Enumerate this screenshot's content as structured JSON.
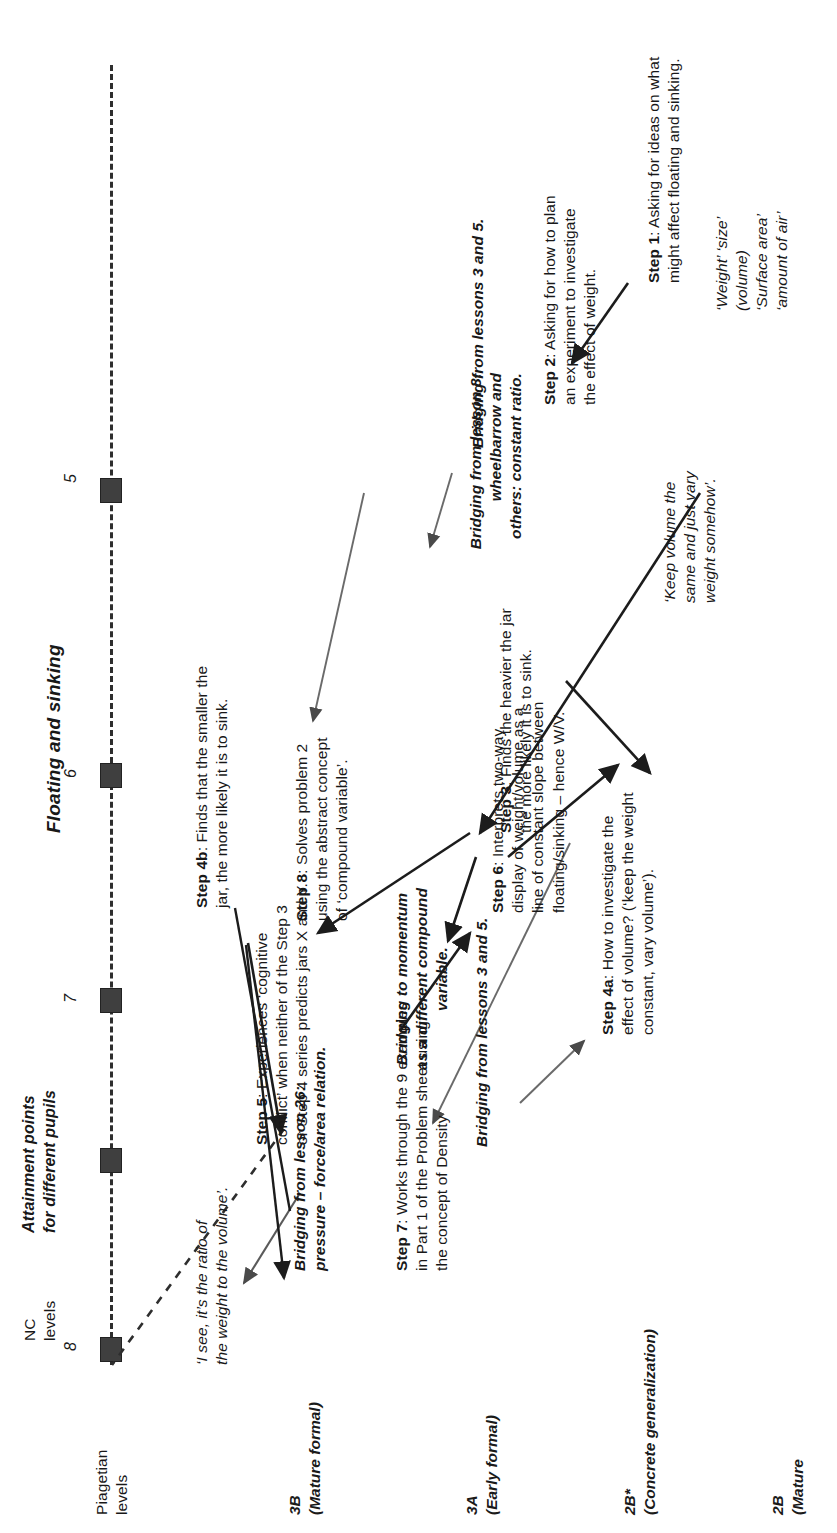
{
  "title": "Floating and sinking",
  "axis": {
    "nc_label": "NC\nlevels",
    "attainment_label": "Attainment points\nfor different pupils",
    "ticks": [
      "8",
      "7",
      "6",
      "5"
    ],
    "marker_count": 5,
    "marker_color": "#3f3f3f"
  },
  "piagetian": {
    "heading": "Piagetian\nlevels",
    "levels": [
      {
        "code": "3B",
        "desc": "(Mature\nformal)"
      },
      {
        "code": "3A",
        "desc": "(Early\nformal)"
      },
      {
        "code": "2B*",
        "desc": "(Concrete\ngeneralization)"
      },
      {
        "code": "2B",
        "desc": "(Mature"
      }
    ]
  },
  "bridges": {
    "momentum": "Bridging to momentum\nas a different compound\nvariable.",
    "lesson26": "Bridging from lesson 26:\npressure – force/area relation.",
    "lesson8": "Bridging from lesson 8:\nwheelbarrow and\nothers: constant ratio.",
    "lessons35_upper": "Bridging from lessons 3 and 5.",
    "lessons35_lower": "Bridging from lessons 3 and 5."
  },
  "quotes": {
    "ratio": "‘I see, it’s the ratio of\nthe weight to the volume’.",
    "keep_volume": "‘Keep volume the\nsame and just vary\nweight somehow’.",
    "ideas_list": "‘Weight’ ‘size’\n(volume)\n‘Surface area’\n‘amount of air’"
  },
  "steps": [
    {
      "id": "step8",
      "label": "Step 8",
      "text": ": Solves problem 2\nusing the abstract concept\nof ‘compound variable’."
    },
    {
      "id": "step7",
      "label": "Step 7",
      "text": ": Works through the 9 examples\nin Part 1 of the Problem sheet using\nthe concept of Density"
    },
    {
      "id": "step6",
      "label": "Step 6",
      "text": ": Interprets two-way\ndisplay of weight/volume as a\nline of constant slope between\nfloating/sinking – hence W/V."
    },
    {
      "id": "step5",
      "label": "Step 5",
      "text": ": Experiences ‘cognitive\nconflict’ when neither of the Step 3\nor Step 4 series predicts jars X and Y."
    },
    {
      "id": "step4a",
      "label": "Step 4a",
      "text": ": How to investigate the\neffect of volume? (‘keep the weight\nconstant, vary volume’)."
    },
    {
      "id": "step4b",
      "label": "Step 4b",
      "text": ": Finds that the smaller the\njar, the more likely it is to sink."
    },
    {
      "id": "step3",
      "label": "Step 3",
      "text": ": Finds the heavier the jar\nthe more likely it is to sink."
    },
    {
      "id": "step2",
      "label": "Step 2",
      "text": ": Asking for how to plan\nan experiment to investigate\nthe effect of weight."
    },
    {
      "id": "step1",
      "label": "Step 1",
      "text": ": Asking for ideas on what\nmight affect floating and sinking."
    }
  ]
}
